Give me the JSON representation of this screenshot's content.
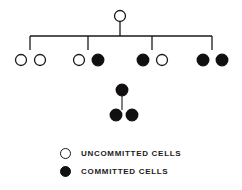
{
  "diagram": {
    "colors": {
      "stroke": "#1a1a1a",
      "committed_fill": "#120f10",
      "uncommitted_fill": "#ffffff",
      "background": "#ffffff"
    },
    "node_radius": 5.5,
    "root": {
      "name": "root-uncommitted-cell",
      "state": "uncommitted",
      "cx": 120,
      "cy": 16
    },
    "connector": {
      "name": "main-bracket",
      "stem_x": 120,
      "stem_top": 22,
      "bar_y": 36,
      "bar_left": 30,
      "bar_right": 212,
      "drop_bottom": 50,
      "drops": [
        30,
        88,
        152,
        212
      ]
    },
    "groups": [
      {
        "name": "group-1",
        "drop_x": 30,
        "cells": [
          {
            "name": "cell-1-1",
            "state": "uncommitted",
            "cx": 21,
            "cy": 60
          },
          {
            "name": "cell-1-2",
            "state": "uncommitted",
            "cx": 40,
            "cy": 60
          }
        ]
      },
      {
        "name": "group-2",
        "drop_x": 88,
        "cells": [
          {
            "name": "cell-2-1",
            "state": "uncommitted",
            "cx": 79,
            "cy": 60
          },
          {
            "name": "cell-2-2",
            "state": "committed",
            "cx": 98,
            "cy": 60
          }
        ]
      },
      {
        "name": "group-3",
        "drop_x": 152,
        "cells": [
          {
            "name": "cell-3-1",
            "state": "committed",
            "cx": 143,
            "cy": 60
          },
          {
            "name": "cell-3-2",
            "state": "uncommitted",
            "cx": 162,
            "cy": 60
          }
        ]
      },
      {
        "name": "group-4",
        "drop_x": 212,
        "cells": [
          {
            "name": "cell-4-1",
            "state": "committed",
            "cx": 203,
            "cy": 60
          },
          {
            "name": "cell-4-2",
            "state": "committed",
            "cx": 222,
            "cy": 60
          }
        ]
      }
    ],
    "subtree": {
      "name": "committed-division-subtree",
      "parent": {
        "name": "subtree-parent-cell",
        "state": "committed",
        "cx": 122,
        "cy": 90
      },
      "stem": {
        "x": 122,
        "top": 95,
        "bottom": 110
      },
      "children": [
        {
          "name": "subtree-child-1",
          "state": "committed",
          "cx": 116,
          "cy": 115
        },
        {
          "name": "subtree-child-2",
          "state": "committed",
          "cx": 132,
          "cy": 115
        }
      ]
    }
  },
  "legend": {
    "name": "legend",
    "items": [
      {
        "key": "uncommitted",
        "marker": "open-circle-icon",
        "label": "UNCOMMITTED CELLS"
      },
      {
        "key": "committed",
        "marker": "filled-circle-icon",
        "label": "COMMITTED CELLS"
      }
    ]
  }
}
